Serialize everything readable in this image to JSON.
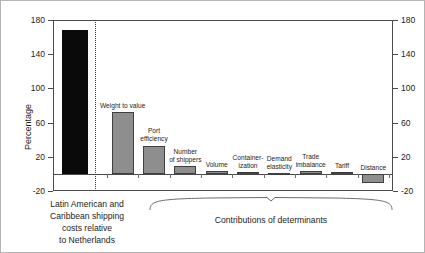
{
  "chart_data": {
    "type": "bar",
    "title": "",
    "subtitle": "",
    "xlabel": "",
    "ylabel": "Percentage",
    "ylim": [
      -20,
      180
    ],
    "yticks": [
      180,
      140,
      100,
      60,
      20,
      -20
    ],
    "right_axis": {
      "label": "",
      "ticks": [
        180,
        140,
        100,
        60,
        20,
        -20
      ],
      "lim": [
        -20,
        180
      ]
    },
    "grid": false,
    "legend": "none",
    "groups": [
      {
        "name": "total",
        "caption": "Latin American and\nCaribbean shipping\ncosts relative\nto Netherlands"
      },
      {
        "name": "determinants",
        "caption": "Contributions of determinants"
      }
    ],
    "categories": [
      "Latin American and Caribbean shipping costs relative to Netherlands",
      "Weight to value",
      "Port efficiency",
      "Number of shippers",
      "Volume",
      "Containerization",
      "Demand elasticity",
      "Trade imbalance",
      "Tariff",
      "Distance"
    ],
    "values": [
      168,
      72,
      33,
      9,
      3,
      2,
      1,
      3,
      2,
      -11
    ],
    "bars": [
      {
        "label": "",
        "label_lines": "",
        "value": 168,
        "group": "total",
        "color": "#0a0a0a",
        "style": "solid-dark"
      },
      {
        "label": "Weight to value",
        "label_lines": "Weight to value",
        "value": 72,
        "group": "determinants",
        "color": "#8e8e8e",
        "style": "solid-grey"
      },
      {
        "label": "Port efficiency",
        "label_lines": "Port\nefficiency",
        "value": 33,
        "group": "determinants",
        "color": "#8e8e8e",
        "style": "solid-grey"
      },
      {
        "label": "Number of shippers",
        "label_lines": "Number\nof shippers",
        "value": 9,
        "group": "determinants",
        "color": "#8e8e8e",
        "style": "solid-grey"
      },
      {
        "label": "Volume",
        "label_lines": "Volume",
        "value": 3,
        "group": "determinants",
        "color": "#8e8e8e",
        "style": "solid-grey"
      },
      {
        "label": "Containerization",
        "label_lines": "Container-\nization",
        "value": 2,
        "group": "determinants",
        "color": "#8e8e8e",
        "style": "solid-grey"
      },
      {
        "label": "Demand elasticity",
        "label_lines": "Demand\nelasticity",
        "value": 1,
        "group": "determinants",
        "color": "#8e8e8e",
        "style": "solid-grey"
      },
      {
        "label": "Trade imbalance",
        "label_lines": "Trade\nimbalance",
        "value": 3,
        "group": "determinants",
        "color": "#8e8e8e",
        "style": "solid-grey"
      },
      {
        "label": "Tariff",
        "label_lines": "Tariff",
        "value": 2,
        "group": "determinants",
        "color": "#8e8e8e",
        "style": "solid-grey"
      },
      {
        "label": "Distance",
        "label_lines": "Distance",
        "value": -11,
        "group": "determinants",
        "color": "#8e8e8e",
        "style": "solid-grey"
      }
    ],
    "annotations": {
      "separator": "dotted vertical line between total bar and determinants"
    }
  },
  "colors": {
    "total_bar": "#0a0a0a",
    "determinant_bar": "#8e8e8e",
    "bar_outline": "#3f3f3f",
    "axis": "#4a4a4a",
    "text": "#1c1c1c",
    "frame": "#b4b4b4",
    "background": "#ffffff"
  }
}
